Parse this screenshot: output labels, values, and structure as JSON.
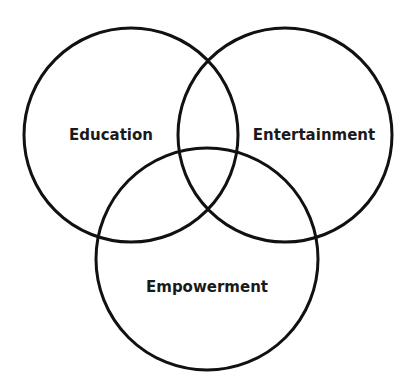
{
  "diagram": {
    "type": "venn",
    "stroke_color": "#111111",
    "background": "#ffffff",
    "sets": [
      {
        "id": "education",
        "label": "Education",
        "cx": 131,
        "cy": 135,
        "r": 107,
        "label_x": 111,
        "label_y": 140
      },
      {
        "id": "entertainment",
        "label": "Entertainment",
        "cx": 285,
        "cy": 135,
        "r": 107,
        "label_x": 314,
        "label_y": 140
      },
      {
        "id": "empowerment",
        "label": "Empowerment",
        "cx": 207,
        "cy": 259,
        "r": 111,
        "label_x": 207,
        "label_y": 292
      }
    ]
  }
}
